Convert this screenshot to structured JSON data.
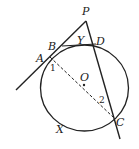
{
  "diagram": {
    "points": {
      "P": "P",
      "A": "A",
      "B": "B",
      "D": "D",
      "C": "C",
      "O": "O",
      "X": "X",
      "Y": "Y"
    },
    "angles": {
      "one": "1",
      "two": "2"
    },
    "colors": {
      "stroke": "#222222",
      "background": "#ffffff"
    }
  }
}
